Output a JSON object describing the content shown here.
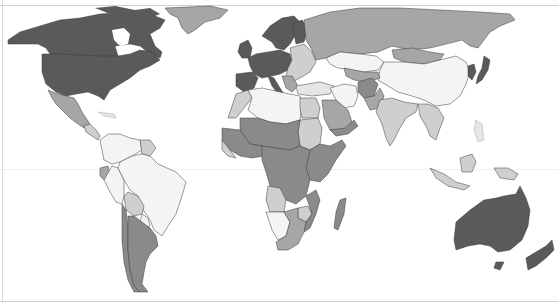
{
  "map": {
    "type": "choropleth",
    "projection": "world (equirectangular-like)",
    "title": "",
    "legend": [],
    "shades": {
      "level_1_lightest": "#f4f4f4",
      "level_2": "#cfcfcf",
      "level_3": "#a6a6a6",
      "level_4": "#8a8a8a",
      "level_5_darkest": "#5a5a5a",
      "border": "#3a3a3a",
      "water": "#ffffff"
    },
    "regions": [
      {
        "name": "Canada",
        "shade": "level_5_darkest"
      },
      {
        "name": "United States",
        "shade": "level_5_darkest"
      },
      {
        "name": "Alaska",
        "shade": "level_5_darkest"
      },
      {
        "name": "Greenland",
        "shade": "level_3"
      },
      {
        "name": "Mexico",
        "shade": "level_3"
      },
      {
        "name": "Central America",
        "shade": "level_2"
      },
      {
        "name": "Colombia / Venezuela",
        "shade": "level_1_lightest"
      },
      {
        "name": "Guianas",
        "shade": "level_2"
      },
      {
        "name": "Ecuador",
        "shade": "level_3"
      },
      {
        "name": "Peru",
        "shade": "level_1_lightest"
      },
      {
        "name": "Brazil",
        "shade": "level_1_lightest"
      },
      {
        "name": "Bolivia",
        "shade": "level_2"
      },
      {
        "name": "Paraguay",
        "shade": "level_1_lightest"
      },
      {
        "name": "Argentina",
        "shade": "level_4"
      },
      {
        "name": "Chile",
        "shade": "level_4"
      },
      {
        "name": "Western Europe",
        "shade": "level_5_darkest"
      },
      {
        "name": "Scandinavia",
        "shade": "level_5_darkest"
      },
      {
        "name": "Eastern Europe",
        "shade": "level_2"
      },
      {
        "name": "Russia",
        "shade": "level_3"
      },
      {
        "name": "Kazakhstan",
        "shade": "level_1_lightest"
      },
      {
        "name": "Mongolia",
        "shade": "level_3"
      },
      {
        "name": "China",
        "shade": "level_1_lightest"
      },
      {
        "name": "Japan / Korea",
        "shade": "level_5_darkest"
      },
      {
        "name": "Central Asia",
        "shade": "level_3"
      },
      {
        "name": "Afghanistan",
        "shade": "level_4"
      },
      {
        "name": "Iran",
        "shade": "level_1_lightest"
      },
      {
        "name": "Pakistan",
        "shade": "level_3"
      },
      {
        "name": "India",
        "shade": "level_2"
      },
      {
        "name": "Southeast Asia",
        "shade": "level_2"
      },
      {
        "name": "Indonesia",
        "shade": "level_2"
      },
      {
        "name": "Papua New Guinea",
        "shade": "level_2"
      },
      {
        "name": "North Africa (Algeria/Libya)",
        "shade": "level_1_lightest"
      },
      {
        "name": "Morocco / Western Sahara",
        "shade": "level_2"
      },
      {
        "name": "Egypt",
        "shade": "level_2"
      },
      {
        "name": "Saudi Arabia",
        "shade": "level_3"
      },
      {
        "name": "Sudan",
        "shade": "level_2"
      },
      {
        "name": "Sahel",
        "shade": "level_4"
      },
      {
        "name": "West Africa",
        "shade": "level_4"
      },
      {
        "name": "Central Africa",
        "shade": "level_4"
      },
      {
        "name": "East Africa",
        "shade": "level_4"
      },
      {
        "name": "Angola",
        "shade": "level_2"
      },
      {
        "name": "Namibia",
        "shade": "level_1_lightest"
      },
      {
        "name": "Southern Africa",
        "shade": "level_3"
      },
      {
        "name": "Madagascar",
        "shade": "level_4"
      },
      {
        "name": "Australia",
        "shade": "level_5_darkest"
      },
      {
        "name": "New Zealand",
        "shade": "level_5_darkest"
      }
    ]
  }
}
